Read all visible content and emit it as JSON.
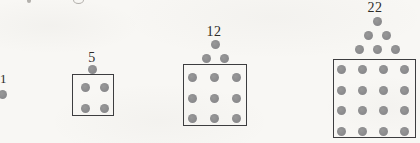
{
  "colors": {
    "background": "#f8f7f4",
    "dot": "#858588",
    "box_border": "#3d3d3f",
    "label": "#2d2b28"
  },
  "diagram": {
    "kind": "dot-pattern-sequence",
    "terms": [
      {
        "label": "1",
        "total_dots": 1,
        "triangle_rows": 0,
        "square_size": 1,
        "boxed": false
      },
      {
        "label": "5",
        "total_dots": 5,
        "triangle_rows": 1,
        "square_size": 2,
        "boxed": true
      },
      {
        "label": "12",
        "total_dots": 12,
        "triangle_rows": 2,
        "square_size": 3,
        "boxed": true
      },
      {
        "label": "22",
        "total_dots": 22,
        "triangle_rows": 3,
        "square_size": 4,
        "boxed": true
      }
    ]
  }
}
